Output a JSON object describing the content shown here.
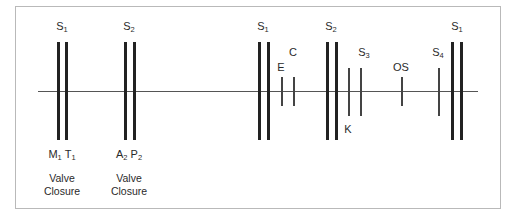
{
  "diagram": {
    "title": "",
    "top_labels": [
      {
        "id": "s1a",
        "base": "S",
        "sub": "1"
      },
      {
        "id": "s2a",
        "base": "S",
        "sub": "2"
      },
      {
        "id": "s1b",
        "base": "S",
        "sub": "1"
      },
      {
        "id": "e",
        "base": "E",
        "sub": ""
      },
      {
        "id": "c",
        "base": "C",
        "sub": ""
      },
      {
        "id": "s2b",
        "base": "S",
        "sub": "2"
      },
      {
        "id": "s3",
        "base": "S",
        "sub": "3"
      },
      {
        "id": "os",
        "base": "OS",
        "sub": ""
      },
      {
        "id": "s4",
        "base": "S",
        "sub": "4"
      },
      {
        "id": "s1c",
        "base": "S",
        "sub": "1"
      }
    ],
    "bottom_labels": {
      "mt": {
        "m": "M",
        "m_sub": "1",
        "t": "T",
        "t_sub": "1"
      },
      "ap": {
        "a": "A",
        "a_sub": "2",
        "p": "P",
        "p_sub": "2"
      },
      "k": "K"
    },
    "captions": [
      {
        "line1": "Valve",
        "line2": "Closure"
      },
      {
        "line1": "Valve",
        "line2": "Closure"
      }
    ]
  }
}
